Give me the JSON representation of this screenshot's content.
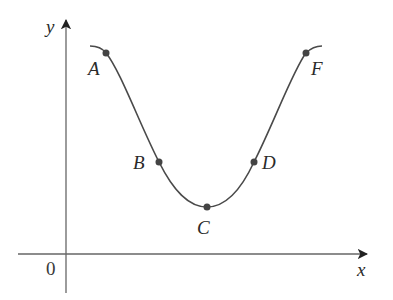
{
  "diagram": {
    "axes": {
      "x_label": "x",
      "y_label": "y",
      "origin_label": "0"
    },
    "curve": {
      "description": "smooth U-shaped (cosine-like) curve with a single minimum",
      "color": "#4a4a4a"
    },
    "points": [
      {
        "label": "A",
        "position": "upper-left, on decreasing part, concave down"
      },
      {
        "label": "B",
        "position": "inflection on left branch"
      },
      {
        "label": "C",
        "position": "local minimum"
      },
      {
        "label": "D",
        "position": "inflection on right branch"
      },
      {
        "label": "F",
        "position": "upper-right, on increasing part, concave down"
      }
    ],
    "colors": {
      "axis": "#555555",
      "curve": "#4a4a4a",
      "point": "#444444",
      "text": "#2a2a2a"
    }
  }
}
